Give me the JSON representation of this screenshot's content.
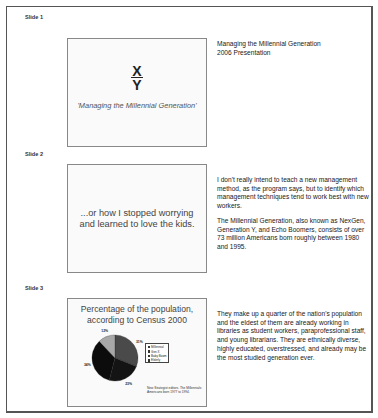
{
  "slides": [
    {
      "label": "Slide 1",
      "content": {
        "x_letter": "X",
        "y_letter": "Y",
        "subtitle": "'Managing the Millennial Generation'"
      },
      "notes": [
        "Managing the Millennial Generation",
        "2006 Presentation"
      ]
    },
    {
      "label": "Slide 2",
      "content": {
        "line1": "...or how I stopped worrying",
        "line2": "and learned to love the kids."
      },
      "notes": [
        "I don't really intend to teach a new management method, as the program says, but to identify which management techniques tend to work best with new workers.",
        "The Millennial Generation, also known as NexGen, Generation Y, and Echo Boomers, consists of over 73 million Americans born roughly between 1980 and 1995."
      ]
    },
    {
      "label": "Slide 3",
      "content": {
        "title_line1": "Percentage of the population,",
        "title_line2": "according to Census 2000",
        "source": "New Strategist editors. The Millennials: Americans born 1977 to 1994."
      },
      "notes": [
        "They make up a quarter of the nation's population and the eldest of them are already working in libraries as student workers, paraprofessional staff, and young librarians.  They are ethnically diverse, highly educated, overstressed, and already may be the most studied generation ever."
      ]
    }
  ],
  "chart_data": {
    "type": "pie",
    "title": "Percentage of the population, according to Census 2000",
    "categories": [
      "Millennial",
      "Gen X",
      "Baby Boom",
      "Elderly"
    ],
    "values": [
      31,
      23,
      34,
      12
    ],
    "labels": [
      "31%",
      "23%",
      "34%",
      "12%"
    ],
    "colors": [
      "#4a4a4a",
      "#141414",
      "#0c0c0c",
      "#a8a8a8"
    ],
    "legend_position": "right",
    "source_note": "New Strategist editors. The Millennials: Americans born 1977 to 1994."
  }
}
